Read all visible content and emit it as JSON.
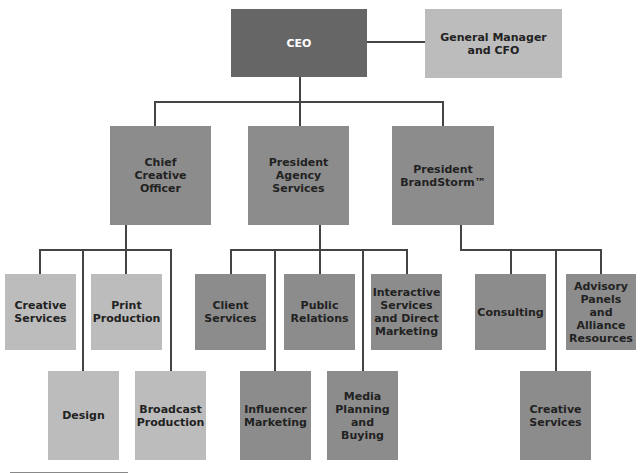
{
  "chart": {
    "ceo": "CEO",
    "gm": "General Manager\nand CFO",
    "cco": "Chief\nCreative\nOfficer",
    "pas": "President\nAgency\nServices",
    "pbs": "President\nBrandStorm™",
    "cco_reports": [
      "Creative\nServices",
      "Print\nProduction",
      "Design",
      "Broadcast\nProduction"
    ],
    "pas_reports": [
      "Client\nServices",
      "Public\nRelations",
      "Interactive\nServices\nand Direct\nMarketing",
      "Influencer\nMarketing",
      "Media\nPlanning\nand Buying"
    ],
    "pbs_reports": [
      "Consulting",
      "Advisory\nPanels and\nAlliance\nResources",
      "Creative\nServices"
    ]
  },
  "colors": {
    "dark": "#666666",
    "mid": "#8c8c8c",
    "light": "#bcbcbc",
    "line": "#444444"
  }
}
